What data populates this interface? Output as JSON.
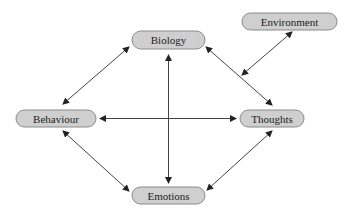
{
  "diagram": {
    "type": "concept-map",
    "colors": {
      "node_fill": "#cfcfcf",
      "node_stroke": "#8a8a8a",
      "text": "#222222",
      "arrow": "#444444",
      "background": "#ffffff"
    },
    "nodes": [
      {
        "id": "biology",
        "label": "Biology",
        "cx": 168.5,
        "cy": 40,
        "rx": 36.5,
        "ry": 9
      },
      {
        "id": "environment",
        "label": "Environment",
        "cx": 289.5,
        "cy": 21.5,
        "rx": 47.5,
        "ry": 8.5
      },
      {
        "id": "behaviour",
        "label": "Behaviour",
        "cx": 56,
        "cy": 118.5,
        "rx": 40,
        "ry": 8.5
      },
      {
        "id": "thoughts",
        "label": "Thoughts",
        "cx": 272,
        "cy": 118.5,
        "rx": 32,
        "ry": 8.5
      },
      {
        "id": "emotions",
        "label": "Emotions",
        "cx": 168.5,
        "cy": 195.5,
        "rx": 36.5,
        "ry": 8.5
      }
    ],
    "edges": [
      {
        "from": "behaviour",
        "to": "biology",
        "bidirectional": true,
        "x1": 63,
        "y1": 104,
        "x2": 129,
        "y2": 47
      },
      {
        "from": "biology",
        "to": "thoughts",
        "bidirectional": true,
        "x1": 206,
        "y1": 47,
        "x2": 272,
        "y2": 105
      },
      {
        "from": "environment",
        "to": "biology-thoughts-link",
        "bidirectional": true,
        "x1": 292,
        "y1": 32,
        "x2": 242,
        "y2": 75
      },
      {
        "from": "behaviour",
        "to": "thoughts",
        "bidirectional": true,
        "x1": 100,
        "y1": 118.5,
        "x2": 236,
        "y2": 118.5
      },
      {
        "from": "biology",
        "to": "emotions",
        "bidirectional": true,
        "x1": 168.5,
        "y1": 55,
        "x2": 168.5,
        "y2": 183
      },
      {
        "from": "behaviour",
        "to": "emotions",
        "bidirectional": true,
        "x1": 63,
        "y1": 131,
        "x2": 129,
        "y2": 191
      },
      {
        "from": "emotions",
        "to": "thoughts",
        "bidirectional": true,
        "x1": 207,
        "y1": 190,
        "x2": 272,
        "y2": 131
      }
    ]
  }
}
